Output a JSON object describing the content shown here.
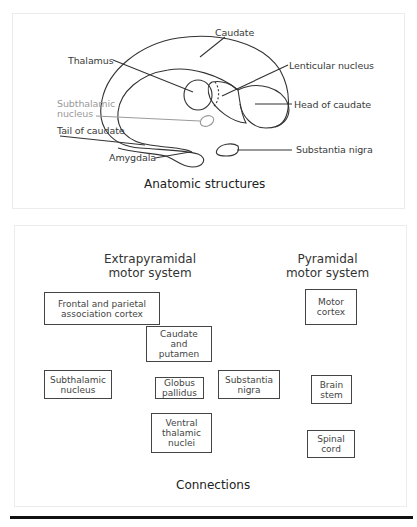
{
  "anatomic_panel": {
    "caption": "Anatomic structures",
    "labels": {
      "caudate": "Caudate",
      "thalamus": "Thalamus",
      "lenticular_nucleus": "Lenticular nucleus",
      "subthalamic_nucleus_line1": "Subthalamic",
      "subthalamic_nucleus_line2": "nucleus",
      "head_of_caudate": "Head of caudate",
      "tail_of_caudate": "Tail of caudate",
      "substantia_nigra": "Substantia nigra",
      "amygdala": "Amygdala"
    },
    "colors": {
      "outline": "#333333",
      "subthalamic": "#9a9a9a"
    }
  },
  "connections_panel": {
    "caption": "Connections",
    "extrapyramidal_heading_line1": "Extrapyramidal",
    "extrapyramidal_heading_line2": "motor system",
    "pyramidal_heading_line1": "Pyramidal",
    "pyramidal_heading_line2": "motor system",
    "boxes": {
      "frontal_line1": "Frontal and parietal",
      "frontal_line2": "association cortex",
      "caudate_line1": "Caudate",
      "caudate_line2": "and",
      "caudate_line3": "putamen",
      "subthalamic_line1": "Subthalamic",
      "subthalamic_line2": "nucleus",
      "globus_line1": "Globus",
      "globus_line2": "pallidus",
      "substantia_line1": "Substantia",
      "substantia_line2": "nigra",
      "ventral_line1": "Ventral",
      "ventral_line2": "thalamic",
      "ventral_line3": "nuclei",
      "motor_line1": "Motor",
      "motor_line2": "cortex",
      "brainstem_line1": "Brain",
      "brainstem_line2": "stem",
      "spinal_line1": "Spinal",
      "spinal_line2": "cord"
    },
    "edges": [
      {
        "from": "Frontal and parietal association cortex",
        "to": "Caudate and putamen"
      },
      {
        "from": "Caudate and putamen",
        "to": "Globus pallidus"
      },
      {
        "from": "Substantia nigra",
        "to": "Caudate and putamen"
      },
      {
        "from": "Subthalamic nucleus",
        "to": "Globus pallidus",
        "bidirectional": true
      },
      {
        "from": "Globus pallidus",
        "to": "Substantia nigra"
      },
      {
        "from": "Globus pallidus",
        "to": "Ventral thalamic nuclei"
      },
      {
        "from": "Ventral thalamic nuclei",
        "to": "Motor cortex"
      },
      {
        "from": "Motor cortex",
        "to": "Brain stem"
      },
      {
        "from": "Brain stem",
        "to": "Spinal cord"
      }
    ]
  }
}
